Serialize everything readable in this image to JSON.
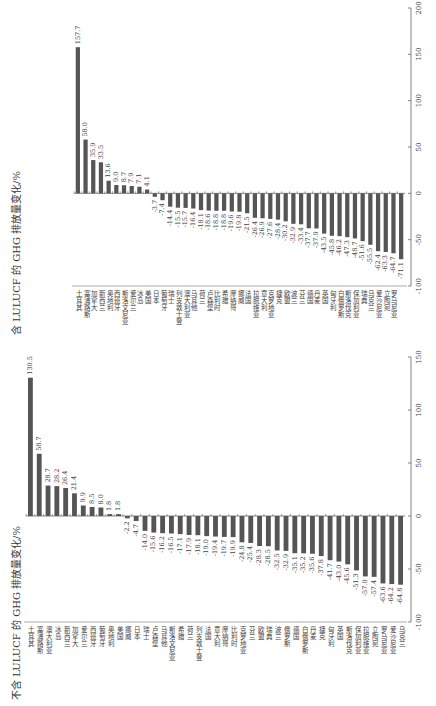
{
  "chart_data": [
    {
      "type": "bar",
      "orientation": "vertical (image rotated 90°)",
      "title": "含 LULUCF 的 GHG 排放量变化/%",
      "xlabel": "",
      "ylabel": "",
      "ylim": [
        -100,
        200
      ],
      "yticks": [
        -100,
        -50,
        0,
        50,
        100,
        150,
        200
      ],
      "categories": [
        "土耳其",
        "塞浦路斯",
        "加拿大",
        "新西兰",
        "奥地利",
        "西班牙",
        "斯洛文尼亚",
        "爱尔兰",
        "冰岛",
        "美国",
        "日本",
        "葡萄牙",
        "瑞士",
        "列支敦士登",
        "澳大利亚",
        "马耳他",
        "荷兰",
        "卢森堡",
        "比利时",
        "希腊",
        "摩纳哥",
        "挪威",
        "法国",
        "拉脱维亚",
        "意大利",
        "克罗地亚",
        "捷克",
        "欧盟",
        "波兰",
        "芬兰",
        "德国",
        "丹麦",
        "英国",
        "匈牙利",
        "白俄罗斯",
        "斯洛伐克",
        "保加利亚",
        "瑞典",
        "乌克兰",
        "爱沙尼亚",
        "立陶宛",
        "罗马尼亚"
      ],
      "values": [
        157.7,
        58.0,
        35.9,
        33.5,
        13.6,
        9.0,
        8.7,
        7.9,
        7.1,
        4.1,
        -3.7,
        -7.4,
        -14.4,
        -15.5,
        -15.7,
        -16.4,
        -18.1,
        -18.6,
        -18.8,
        -18.8,
        -19.6,
        -19.8,
        -21.5,
        -26.4,
        -26.9,
        -27.6,
        -28.4,
        -30.2,
        -32.9,
        -33.4,
        -37.7,
        -37.9,
        -43.5,
        -45.8,
        -46.2,
        -47.3,
        -48.7,
        -51.6,
        -55.5,
        -62.4,
        -63.3,
        -64.7,
        -71.1
      ],
      "value_labels": [
        "157.7",
        "58.0",
        "35.9",
        "33.5",
        "13.6",
        "9.0",
        "8.7",
        "7.9",
        "7.1",
        "4.1",
        "-3.7",
        "-7.4",
        "-14.4",
        "-15.5",
        "-15.7",
        "-16.4",
        "-18.1",
        "-18.6",
        "-18.8",
        "-18.8",
        "-19.6",
        "-19.8",
        "-21.5",
        "-26.4",
        "-26.9",
        "-27.6",
        "-28.4",
        "-30.2",
        "-32.9",
        "-33.4",
        "-37.7",
        "-37.9",
        "-43.5",
        "-45.8",
        "-46.2",
        "-47.3",
        "-48.7",
        "-51.6",
        "-55.5",
        "-62.4",
        "-63.3",
        "-64.7",
        "-71.1"
      ],
      "bar_color": "#555555",
      "grid": false,
      "legend": "none"
    },
    {
      "type": "bar",
      "orientation": "vertical (image rotated 90°)",
      "title": "不含 LULUCF 的 GHG 排放量变化/%",
      "xlabel": "",
      "ylabel": "",
      "ylim": [
        -100,
        150
      ],
      "yticks": [
        -100,
        -50,
        0,
        50,
        100,
        150
      ],
      "categories": [
        "土耳其",
        "塞浦路斯",
        "澳大利亚",
        "冰岛",
        "新西兰",
        "加拿大",
        "爱尔兰",
        "西班牙",
        "葡萄牙",
        "奥地利",
        "美国",
        "挪威",
        "日本",
        "瑞士",
        "卢森堡",
        "马耳他",
        "斯洛文尼亚",
        "希腊",
        "荷兰",
        "列支敦士登",
        "法国",
        "意大利",
        "摩纳哥",
        "比利时",
        "克罗地亚",
        "芬兰",
        "欧盟",
        "瑞典",
        "波兰",
        "俄罗斯",
        "德国",
        "白俄罗斯",
        "丹麦",
        "捷克",
        "匈牙利",
        "英国",
        "斯洛伐克",
        "保加利亚",
        "拉脱维亚",
        "立陶宛",
        "罗马尼亚",
        "爱沙尼亚",
        "乌克兰"
      ],
      "values": [
        130.5,
        58.7,
        28.7,
        28.2,
        26.4,
        21.4,
        9.9,
        8.5,
        8.0,
        1.8,
        1.8,
        -2.2,
        -4.7,
        -14.0,
        -15.6,
        -16.2,
        -16.5,
        -17.1,
        -17.9,
        -18.1,
        -19.0,
        -19.4,
        -19.7,
        -19.9,
        -24.8,
        -25.4,
        -28.3,
        -28.5,
        -32.5,
        -32.9,
        -35.1,
        -35.2,
        -35.6,
        -37.8,
        -41.7,
        -43.0,
        -45.6,
        -51.3,
        -57.0,
        -57.4,
        -63.6,
        -64.2,
        -64.8
      ],
      "value_labels": [
        "130.5",
        "58.7",
        "28.7",
        "28.2",
        "26.4",
        "21.4",
        "9.9",
        "8.5",
        "8.0",
        "1.8",
        "1.8",
        "-2.2",
        "-4.7",
        "-14.0",
        "-15.6",
        "-16.2",
        "-16.5",
        "-17.1",
        "-17.9",
        "-18.1",
        "-19.0",
        "-19.4",
        "-19.7",
        "-19.9",
        "-24.8",
        "-25.4",
        "-28.3",
        "-28.5",
        "-32.5",
        "-32.9",
        "-35.1",
        "-35.2",
        "-35.6",
        "-37.8",
        "-41.7",
        "-43.0",
        "-45.6",
        "-51.3",
        "-57.0",
        "-57.4",
        "-63.6",
        "-64.2",
        "-64.8"
      ],
      "bar_color": "#555555",
      "grid": false,
      "legend": "none"
    }
  ]
}
